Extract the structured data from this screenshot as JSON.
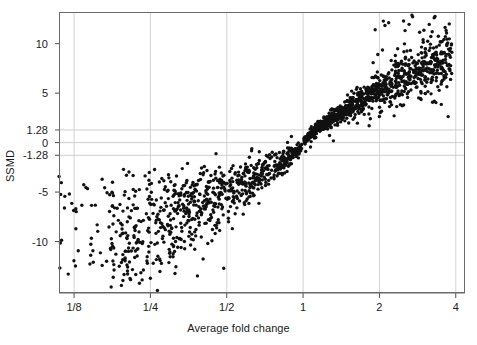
{
  "chart_data": {
    "type": "scatter",
    "title": "",
    "xlabel": "Average fold change",
    "ylabel": "SSMD",
    "x_scale": "log2",
    "x_ticks": [
      {
        "label": "1/8",
        "value": 0.125
      },
      {
        "label": "1/4",
        "value": 0.25
      },
      {
        "label": "1/2",
        "value": 0.5
      },
      {
        "label": "1",
        "value": 1
      },
      {
        "label": "2",
        "value": 2
      },
      {
        "label": "4",
        "value": 4
      }
    ],
    "y_ticks": [
      {
        "label": "10",
        "value": 10
      },
      {
        "label": "5",
        "value": 5
      },
      {
        "label": "1.28",
        "value": 1.28
      },
      {
        "label": "0",
        "value": 0
      },
      {
        "label": "-1.28",
        "value": -1.28
      },
      {
        "label": "-5",
        "value": -5
      },
      {
        "label": "-10",
        "value": -10
      }
    ],
    "xlim": [
      0.109,
      4.35
    ],
    "ylim": [
      -15.2,
      13.2
    ],
    "grid": {
      "horizontal_lines": [
        1.28,
        0,
        -1.28
      ],
      "vertical_lines": [
        0.125,
        0.25,
        0.5,
        1,
        2,
        4
      ],
      "color": "#c8c8c8"
    },
    "legend": null,
    "marker": {
      "shape": "circle",
      "size": 1.7,
      "color": "#111111"
    },
    "series": [
      {
        "name": "wells",
        "n_points": 1680,
        "description": "Monotonic relationship between average fold change (log2 x-axis) and SSMD; points converge tightly at (1, 0) and fan outward with greater spread at extreme fold changes. Upregulated arm (fold change > 1) is dense and reaches SSMD ~13; downregulated arm (fold change < 1) is more diffuse and reaches SSMD ~-15."
      }
    ]
  },
  "plot_box": {
    "left": 59,
    "top": 12,
    "right": 465,
    "bottom": 293,
    "border_color": "#6b6b6b"
  }
}
